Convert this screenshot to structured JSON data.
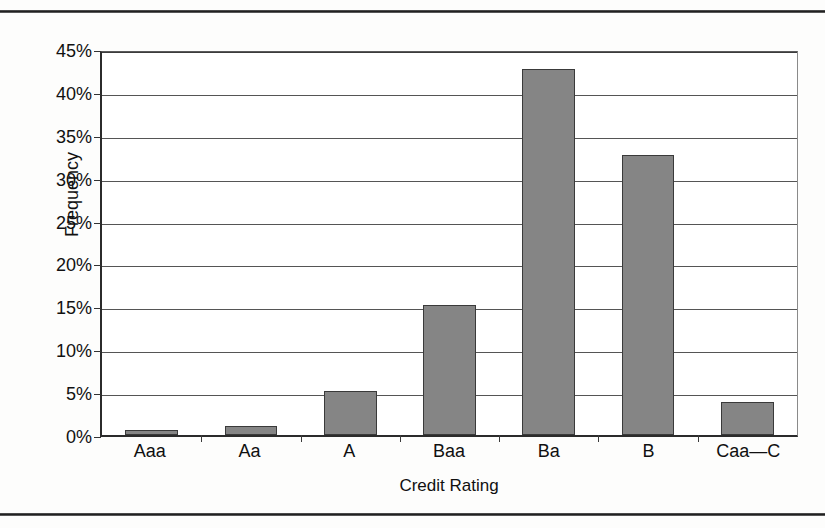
{
  "chart_data": {
    "type": "bar",
    "title": "",
    "xlabel": "Credit Rating",
    "ylabel": "Frequency",
    "categories": [
      "Aaa",
      "Aa",
      "A",
      "Baa",
      "Ba",
      "B",
      "Caa—C"
    ],
    "values": [
      0.6,
      1.1,
      5.1,
      15.2,
      42.7,
      32.7,
      3.8
    ],
    "value_labels": [
      "0.6%",
      "1.1%",
      "5.1%",
      "15.2%",
      "42.7%",
      "32.7%",
      "3.8%"
    ],
    "ylim": [
      0,
      45
    ],
    "ytick_values": [
      0,
      5,
      10,
      15,
      20,
      25,
      30,
      35,
      40,
      45
    ],
    "ytick_labels": [
      "0%",
      "5%",
      "10%",
      "15%",
      "20%",
      "25%",
      "30%",
      "35%",
      "40%",
      "45%"
    ],
    "grid": true,
    "legend": "none",
    "bar_color": "#858585",
    "bar_border_color": "#3a3a3a",
    "axis_color": "#2b2b2b",
    "gridline_color": "#3c3c3c"
  }
}
